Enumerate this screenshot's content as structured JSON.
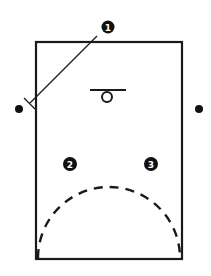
{
  "diagram": {
    "type": "basketball-half-court-play",
    "colors": {
      "ink": "#111111",
      "background": "#ffffff"
    },
    "players": [
      {
        "id": "1",
        "label": "1",
        "x": 108,
        "y": 27
      },
      {
        "id": "2",
        "label": "2",
        "x": 70,
        "y": 164
      },
      {
        "id": "3",
        "label": "3",
        "x": 151,
        "y": 164
      }
    ],
    "outside_markers": [
      {
        "id": "left-dot",
        "x": 19,
        "y": 109
      },
      {
        "id": "right-dot",
        "x": 199,
        "y": 109
      }
    ],
    "basket": {
      "backboard_x1": 90,
      "backboard_x2": 126,
      "backboard_y": 90,
      "rim_cx": 107,
      "rim_cy": 97,
      "rim_r": 5
    },
    "court_rect": {
      "x": 36,
      "y": 42,
      "width": 146,
      "height": 217
    },
    "movement_line": {
      "from": [
        97,
        36
      ],
      "to": [
        30,
        103
      ],
      "end_cap": "screen-bar"
    },
    "dashed_arc": {
      "style": "dashed",
      "from": [
        38,
        258
      ],
      "to": [
        180,
        258
      ]
    }
  }
}
